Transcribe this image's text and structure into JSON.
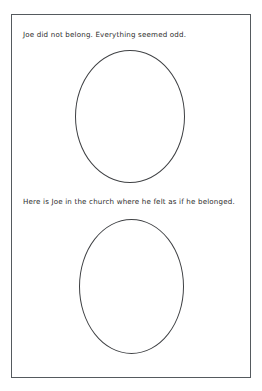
{
  "page": {
    "background_color": "#ffffff",
    "border_color": "#555a5e",
    "text_color": "#2b2b2b",
    "oval_outline_color": "#3f4144"
  },
  "sections": [
    {
      "prompt": "Joe did not belong. Everything seemed odd.",
      "drawing_area_shape": "oval",
      "drawing_area_content": ""
    },
    {
      "prompt": "Here is Joe in the church where he felt as if he belonged.",
      "drawing_area_shape": "oval",
      "drawing_area_content": ""
    }
  ]
}
